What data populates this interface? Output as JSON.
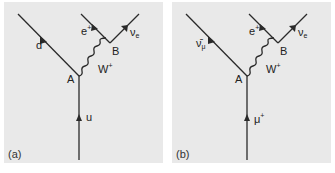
{
  "figure": {
    "panels": [
      {
        "id": "a",
        "caption": "(a)",
        "vertices": {
          "A": "A",
          "B": "B"
        },
        "incoming": {
          "base": "u",
          "sup": ""
        },
        "outgoing_left": {
          "base": "d",
          "sub": ""
        },
        "boson": {
          "base": "W",
          "sup": "+"
        },
        "lepton": {
          "base": "e",
          "sup": "+"
        },
        "neutrino": {
          "base": "ν",
          "sub": "e"
        }
      },
      {
        "id": "b",
        "caption": "(b)",
        "vertices": {
          "A": "A",
          "B": "B"
        },
        "incoming": {
          "base": "μ",
          "sup": "+"
        },
        "outgoing_left": {
          "base": "ν̄",
          "sub": "μ"
        },
        "boson": {
          "base": "W",
          "sup": "+"
        },
        "lepton": {
          "base": "e",
          "sup": "+"
        },
        "neutrino": {
          "base": "ν",
          "sub": "e"
        }
      }
    ],
    "colors": {
      "panel_bg": "#e9e9e9",
      "line": "#2a2a2a",
      "text": "#222222"
    }
  }
}
